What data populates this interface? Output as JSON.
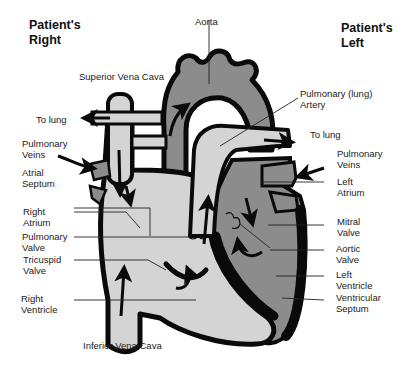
{
  "headers": {
    "patient_right": "Patient's\nRight",
    "patient_left": "Patient's\nLeft"
  },
  "labels": {
    "aorta": "Aorta",
    "superior_vena_cava": "Superior Vena Cava",
    "to_lung_right": "To lung",
    "pulmonary_veins_right": "Pulmonary\nVeins",
    "atrial_septum": "Atrial\nSeptum",
    "right_atrium": "Right\nAtrium",
    "pulmonary_valve": "Pulmonary\nValve",
    "tricuspid_valve": "Tricuspid\nValve",
    "right_ventricle": "Right\nVentricle",
    "inferior_vena_cava": "Inferior Vena Cava",
    "pulmonary_artery": "Pulmonary (lung)\nArtery",
    "to_lung_left": "To lung",
    "pulmonary_veins_left": "Pulmonary\nVeins",
    "left_atrium": "Left\nAtrium",
    "mitral_valve": "Mitral\nValve",
    "aortic_valve": "Aortic\nValve",
    "left_ventricle": "Left\nVentricle",
    "ventricular_septum": "Ventricular\nSeptum"
  },
  "colors": {
    "oxygenated": "#8c8c8c",
    "deoxygenated": "#d4d4d4",
    "wall": "#0a0a0a",
    "background": "#ffffff"
  }
}
